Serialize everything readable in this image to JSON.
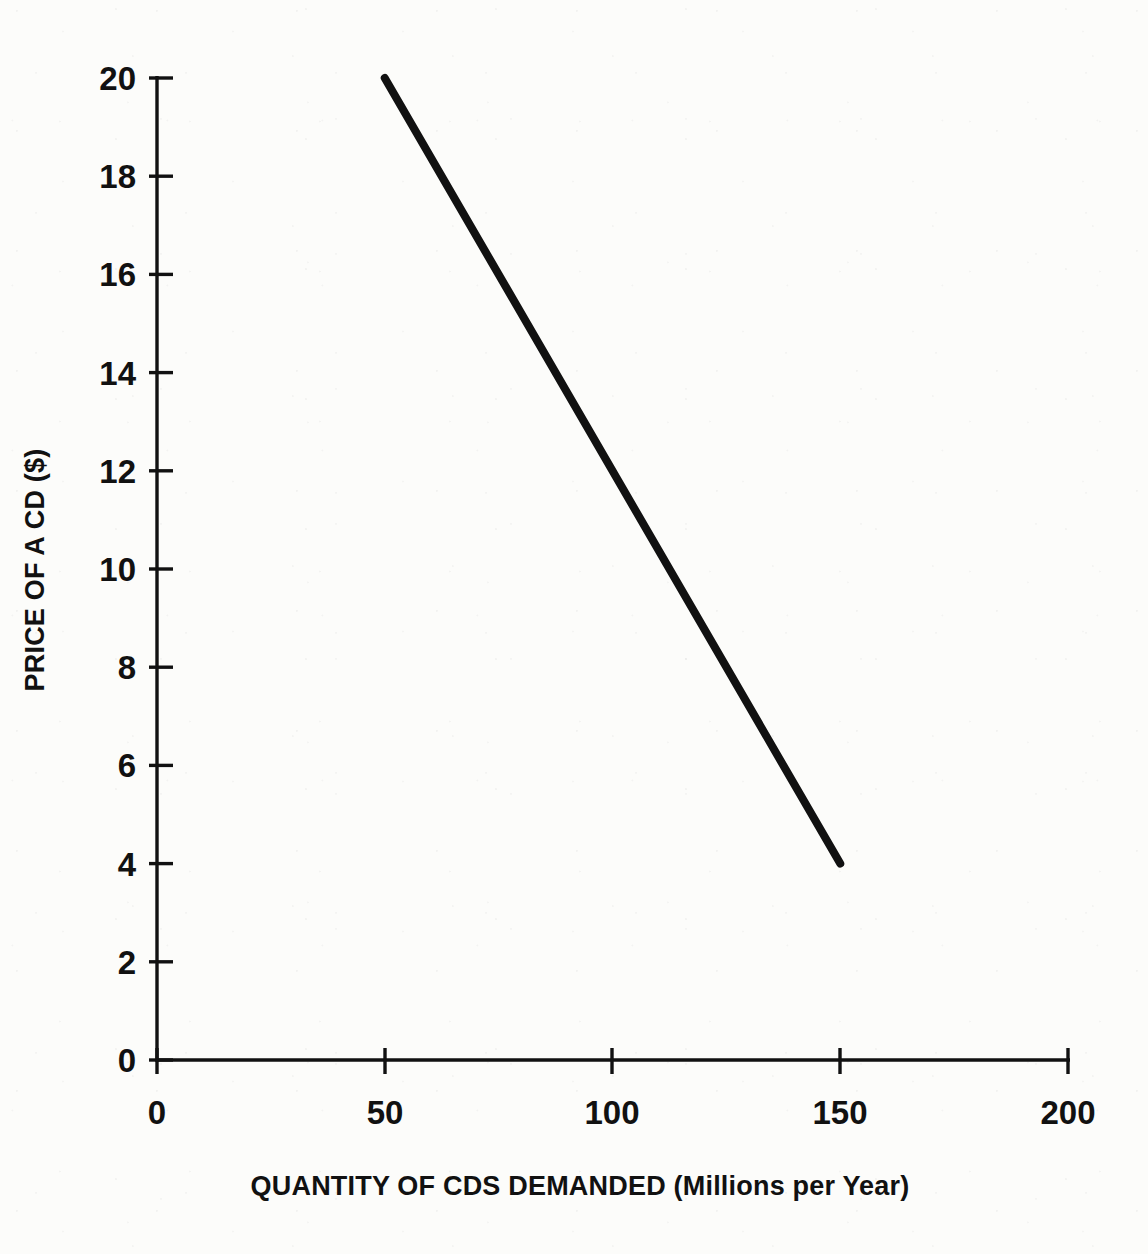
{
  "chart_data": {
    "type": "line",
    "title": "",
    "subtitle": "",
    "xlabel": "QUANTITY OF CDS DEMANDED (Millions per Year)",
    "ylabel": "PRICE OF A CD ($)",
    "xlim": [
      0,
      200
    ],
    "ylim": [
      0,
      20
    ],
    "xticks": [
      0,
      50,
      100,
      150,
      200
    ],
    "yticks": [
      0,
      2,
      4,
      6,
      8,
      10,
      12,
      14,
      16,
      18,
      20
    ],
    "xtick_labels": [
      "0",
      "50",
      "100",
      "150",
      "200"
    ],
    "ytick_labels": [
      "0",
      "2",
      "4",
      "6",
      "8",
      "10",
      "12",
      "14",
      "16",
      "18",
      "20"
    ],
    "grid": false,
    "legend": false,
    "legend_position": "none",
    "annotations": [],
    "series": [
      {
        "name": "Demand",
        "color": "#111111",
        "line_width": 8,
        "x": [
          50,
          150
        ],
        "y": [
          20,
          4
        ],
        "points": [
          {
            "x": 50,
            "y": 20
          },
          {
            "x": 150,
            "y": 4
          }
        ]
      }
    ]
  },
  "axes": {
    "x_title": "QUANTITY OF CDS DEMANDED (Millions per Year)",
    "y_title": "PRICE OF A CD ($)",
    "x_tick_labels": [
      "0",
      "50",
      "100",
      "150",
      "200"
    ],
    "y_tick_labels": [
      "0",
      "2",
      "4",
      "6",
      "8",
      "10",
      "12",
      "14",
      "16",
      "18",
      "20"
    ]
  },
  "colors": {
    "background": "#fcfcfa",
    "axis": "#111111",
    "curve": "#111111",
    "text": "#111111"
  }
}
